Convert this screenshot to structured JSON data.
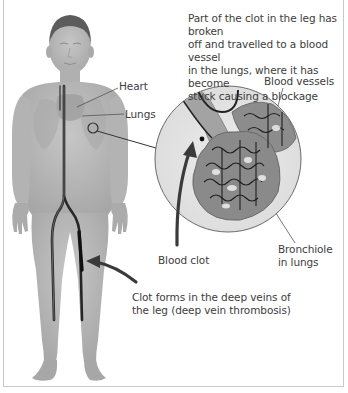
{
  "figure": {
    "labels": {
      "top_caption": [
        "Part of the clot in the leg has broken",
        "off and travelled to a blood vessel",
        "in the lungs, where it has become",
        "stuck causing a blockage"
      ],
      "heart": "Heart",
      "lungs": "Lungs",
      "blood_vessels": "Blood vessels",
      "blood_clot": "Blood clot",
      "bronchiole": [
        "Bronchiole",
        "in lungs"
      ],
      "bottom_caption": [
        "Clot forms in the deep veins of",
        "the leg (deep vein thrombosis)"
      ]
    },
    "elements": {
      "body_figure": "human-body-front-view",
      "magnified_view": "lung-alveoli-magnified-circle",
      "arrow_clot_leg": "arrow-pointing-to-leg-vein",
      "arrow_clot_lung": "arrow-pointing-to-lung-vessel"
    },
    "colors": {
      "skin": "#b9b9b9",
      "skin_shadow": "#9a9a9a",
      "hair": "#5a5a5a",
      "vein": "#2a2a2a",
      "magnifier_fill": "#e4e4e4",
      "tissue": "#8f8f8f",
      "label_text": "#3d3d3d",
      "leader_line": "#555555",
      "frame_border": "#c9c9c9"
    }
  }
}
